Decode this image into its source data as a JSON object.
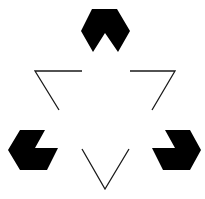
{
  "figure": {
    "colors": {
      "background": "#ffffff",
      "inducers": "#000000",
      "lines": "#1a1a1a"
    },
    "inducers": [
      {
        "name": "top-inducer"
      },
      {
        "name": "left-inducer"
      },
      {
        "name": "right-inducer"
      }
    ],
    "outline_triangle": {
      "orientation": "pointing-down",
      "style": "fragmented-outline"
    }
  }
}
